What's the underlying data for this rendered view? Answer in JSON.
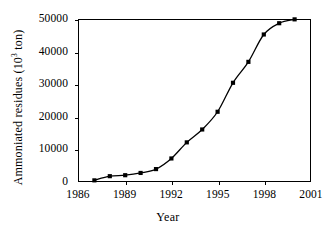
{
  "chart_data": {
    "type": "line",
    "title": "",
    "xlabel": "Year",
    "ylabel": "Ammoniated residues",
    "ylabel_unit_prefix": "(10",
    "ylabel_unit_exponent": "3",
    "ylabel_unit_suffix": " ton)",
    "xlim": [
      1986,
      2001
    ],
    "ylim": [
      0,
      50000
    ],
    "grid": false,
    "legend": false,
    "marker": "filled-square",
    "line_color": "#000000",
    "marker_color": "#000000",
    "x_tick_labels": [
      "1986",
      "1989",
      "1992",
      "1995",
      "1998",
      "2001"
    ],
    "x_ticks": [
      1986,
      1989,
      1992,
      1995,
      1998,
      2001
    ],
    "y_tick_labels": [
      "0",
      "10000",
      "20000",
      "30000",
      "40000",
      "50000"
    ],
    "y_ticks": [
      0,
      10000,
      20000,
      30000,
      40000,
      50000
    ],
    "x": [
      1987,
      1988,
      1989,
      1990,
      1991,
      1992,
      1993,
      1994,
      1995,
      1996,
      1997,
      1998,
      1999,
      2000
    ],
    "values": [
      200,
      1500,
      1800,
      2500,
      3700,
      7000,
      12000,
      16000,
      21500,
      30500,
      37000,
      45500,
      49000,
      50200
    ],
    "series": [
      {
        "name": "Ammoniated residues",
        "values": [
          200,
          1500,
          1800,
          2500,
          3700,
          7000,
          12000,
          16000,
          21500,
          30500,
          37000,
          45500,
          49000,
          50200
        ]
      }
    ]
  }
}
